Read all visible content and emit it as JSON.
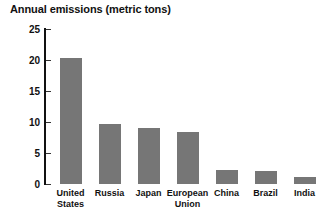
{
  "chart_data": {
    "type": "bar",
    "title": "Annual emissions (metric tons)",
    "xlabel": "",
    "ylabel": "",
    "ylim": [
      0,
      25
    ],
    "yticks": [
      0,
      5,
      10,
      15,
      20,
      25
    ],
    "grid": false,
    "legend": false,
    "bar_color": "#767676",
    "categories": [
      "United\nStates",
      "Russia",
      "Japan",
      "European\nUnion",
      "China",
      "Brazil",
      "India"
    ],
    "values": [
      20.3,
      9.7,
      9.0,
      8.4,
      2.3,
      2.1,
      1.2
    ]
  }
}
